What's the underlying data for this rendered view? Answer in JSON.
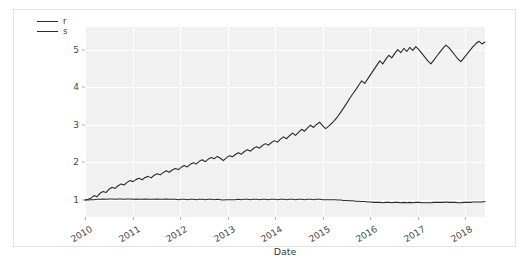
{
  "chart_data": {
    "type": "line",
    "title": "",
    "xlabel": "Date",
    "ylabel": "",
    "grid": true,
    "legend_position": "upper left",
    "xlim": [
      "2010-01-01",
      "2018-06-01"
    ],
    "ylim": [
      0.55,
      5.6
    ],
    "yticks": [
      1,
      2,
      3,
      4,
      5
    ],
    "xticks": [
      "2010",
      "2011",
      "2012",
      "2013",
      "2014",
      "2015",
      "2016",
      "2017",
      "2018"
    ],
    "colors": {
      "r": "#2b2b2b",
      "s": "#2b2b2b",
      "plot_background": "#f1f1f2",
      "gridline": "#ffffff",
      "frame": "#e3e3e3",
      "tick_text": "#4a4a4a"
    },
    "series": [
      {
        "name": "r",
        "values": [
          1.0,
          1.02,
          1.05,
          1.12,
          1.09,
          1.18,
          1.23,
          1.2,
          1.29,
          1.34,
          1.31,
          1.38,
          1.43,
          1.4,
          1.47,
          1.52,
          1.49,
          1.55,
          1.58,
          1.54,
          1.6,
          1.63,
          1.59,
          1.66,
          1.7,
          1.67,
          1.73,
          1.78,
          1.74,
          1.8,
          1.84,
          1.81,
          1.87,
          1.92,
          1.88,
          1.95,
          1.99,
          1.96,
          2.03,
          2.07,
          2.02,
          2.09,
          2.13,
          2.1,
          2.16,
          2.11,
          2.05,
          2.12,
          2.18,
          2.15,
          2.21,
          2.26,
          2.22,
          2.29,
          2.34,
          2.3,
          2.37,
          2.42,
          2.38,
          2.45,
          2.5,
          2.46,
          2.53,
          2.58,
          2.54,
          2.62,
          2.68,
          2.63,
          2.71,
          2.78,
          2.72,
          2.8,
          2.88,
          2.83,
          2.92,
          2.99,
          2.93,
          3.01,
          3.07,
          2.98,
          2.9,
          2.96,
          3.04,
          3.12,
          3.22,
          3.33,
          3.45,
          3.57,
          3.7,
          3.82,
          3.93,
          4.05,
          4.17,
          4.1,
          4.22,
          4.34,
          4.46,
          4.58,
          4.7,
          4.62,
          4.74,
          4.85,
          4.78,
          4.9,
          5.0,
          4.92,
          5.03,
          4.95,
          5.06,
          4.98,
          5.08,
          5.0,
          4.9,
          4.8,
          4.7,
          4.62,
          4.72,
          4.83,
          4.93,
          5.03,
          5.12,
          5.05,
          4.95,
          4.85,
          4.75,
          4.68,
          4.78,
          4.88,
          4.98,
          5.08,
          5.16,
          5.22,
          5.15,
          5.2
        ]
      },
      {
        "name": "s",
        "values": [
          1.0,
          1.0,
          1.01,
          1.01,
          1.02,
          1.02,
          1.03,
          1.02,
          1.03,
          1.03,
          1.02,
          1.03,
          1.03,
          1.02,
          1.03,
          1.03,
          1.02,
          1.03,
          1.02,
          1.02,
          1.03,
          1.02,
          1.02,
          1.02,
          1.03,
          1.02,
          1.02,
          1.03,
          1.02,
          1.02,
          1.02,
          1.01,
          1.02,
          1.02,
          1.01,
          1.02,
          1.02,
          1.01,
          1.02,
          1.02,
          1.01,
          1.02,
          1.02,
          1.01,
          1.02,
          1.01,
          1.0,
          1.01,
          1.01,
          1.01,
          1.01,
          1.02,
          1.01,
          1.02,
          1.02,
          1.01,
          1.02,
          1.02,
          1.01,
          1.02,
          1.02,
          1.01,
          1.02,
          1.02,
          1.01,
          1.02,
          1.02,
          1.01,
          1.02,
          1.02,
          1.01,
          1.02,
          1.02,
          1.01,
          1.02,
          1.02,
          1.01,
          1.02,
          1.02,
          1.01,
          1.01,
          1.01,
          1.01,
          1.01,
          1.0,
          1.0,
          0.99,
          0.99,
          0.98,
          0.98,
          0.97,
          0.97,
          0.96,
          0.96,
          0.95,
          0.95,
          0.94,
          0.94,
          0.94,
          0.93,
          0.94,
          0.94,
          0.93,
          0.94,
          0.94,
          0.93,
          0.94,
          0.93,
          0.94,
          0.93,
          0.94,
          0.94,
          0.93,
          0.93,
          0.93,
          0.93,
          0.94,
          0.94,
          0.94,
          0.94,
          0.95,
          0.94,
          0.94,
          0.94,
          0.93,
          0.93,
          0.94,
          0.94,
          0.94,
          0.95,
          0.95,
          0.95,
          0.95,
          0.96
        ]
      }
    ],
    "legend": [
      {
        "label": "r"
      },
      {
        "label": "s"
      }
    ]
  }
}
